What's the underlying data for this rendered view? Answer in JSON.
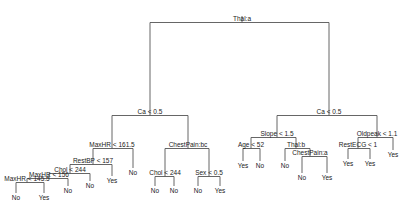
{
  "diagram": {
    "type": "decision-tree",
    "nodes": [
      {
        "id": "root",
        "label": "Thal:a",
        "x": 242,
        "y": 21
      },
      {
        "id": "L",
        "label": "Ca < 0.5",
        "x": 150,
        "y": 114
      },
      {
        "id": "R",
        "label": "Ca < 0.5",
        "x": 329,
        "y": 114
      },
      {
        "id": "LL",
        "label": "MaxHR < 161.5",
        "x": 112,
        "y": 147
      },
      {
        "id": "LR",
        "label": "ChestPain:bc",
        "x": 188,
        "y": 147
      },
      {
        "id": "LLL",
        "label": "RestBP < 157",
        "x": 93,
        "y": 163
      },
      {
        "id": "LLR",
        "label": "No",
        "x": 133,
        "y": 175
      },
      {
        "id": "LLLL",
        "label": "Chol < 244",
        "x": 70,
        "y": 172
      },
      {
        "id": "LLLR",
        "label": "Yes",
        "x": 112,
        "y": 183
      },
      {
        "id": "LLLLL",
        "label": "MaxHR < 156",
        "x": 49,
        "y": 177
      },
      {
        "id": "LLLLR",
        "label": "No",
        "x": 90,
        "y": 188
      },
      {
        "id": "LLLLLL",
        "label": "MaxHR < 145.5",
        "x": 27,
        "y": 181
      },
      {
        "id": "LLLLLR",
        "label": "No",
        "x": 68,
        "y": 193
      },
      {
        "id": "l1",
        "label": "No",
        "x": 16,
        "y": 200
      },
      {
        "id": "l2",
        "label": "Yes",
        "x": 44,
        "y": 200
      },
      {
        "id": "LRL",
        "label": "Chol < 244",
        "x": 165,
        "y": 175
      },
      {
        "id": "LRR",
        "label": "Sex < 0.5",
        "x": 209,
        "y": 175
      },
      {
        "id": "l3",
        "label": "No",
        "x": 155,
        "y": 193
      },
      {
        "id": "l4",
        "label": "No",
        "x": 174,
        "y": 193
      },
      {
        "id": "l5",
        "label": "No",
        "x": 198,
        "y": 193
      },
      {
        "id": "l6",
        "label": "Yes",
        "x": 220,
        "y": 193
      },
      {
        "id": "RL",
        "label": "Slope < 1.5",
        "x": 277,
        "y": 136
      },
      {
        "id": "RR",
        "label": "Oldpeak < 1.1",
        "x": 377,
        "y": 136
      },
      {
        "id": "RLL",
        "label": "Age < 52",
        "x": 251,
        "y": 147
      },
      {
        "id": "RLR",
        "label": "Thal:b",
        "x": 296,
        "y": 147
      },
      {
        "id": "l7",
        "label": "Yes",
        "x": 243,
        "y": 168
      },
      {
        "id": "l8",
        "label": "No",
        "x": 260,
        "y": 168
      },
      {
        "id": "l9",
        "label": "No",
        "x": 285,
        "y": 168
      },
      {
        "id": "RLRR",
        "label": "ChestPain:a",
        "x": 310,
        "y": 155
      },
      {
        "id": "l10",
        "label": "No",
        "x": 302,
        "y": 180
      },
      {
        "id": "l11",
        "label": "Yes",
        "x": 327,
        "y": 180
      },
      {
        "id": "RRL",
        "label": "RestECG < 1",
        "x": 358,
        "y": 147
      },
      {
        "id": "RRR",
        "label": "Yes",
        "x": 393,
        "y": 157
      },
      {
        "id": "l12",
        "label": "Yes",
        "x": 348,
        "y": 166
      },
      {
        "id": "l13",
        "label": "Yes",
        "x": 370,
        "y": 166
      }
    ],
    "edges": [
      {
        "parent": "root",
        "left": "L",
        "right": "R"
      },
      {
        "parent": "L",
        "left": "LL",
        "right": "LR"
      },
      {
        "parent": "LL",
        "left": "LLL",
        "right": "LLR"
      },
      {
        "parent": "LLL",
        "left": "LLLL",
        "right": "LLLR"
      },
      {
        "parent": "LLLL",
        "left": "LLLLL",
        "right": "LLLLR"
      },
      {
        "parent": "LLLLL",
        "left": "LLLLLL",
        "right": "LLLLLR"
      },
      {
        "parent": "LLLLLL",
        "left": "l1",
        "right": "l2"
      },
      {
        "parent": "LR",
        "left": "LRL",
        "right": "LRR"
      },
      {
        "parent": "LRL",
        "left": "l3",
        "right": "l4"
      },
      {
        "parent": "LRR",
        "left": "l5",
        "right": "l6"
      },
      {
        "parent": "R",
        "left": "RL",
        "right": "RR"
      },
      {
        "parent": "RL",
        "left": "RLL",
        "right": "RLR"
      },
      {
        "parent": "RLL",
        "left": "l7",
        "right": "l8"
      },
      {
        "parent": "RLR",
        "left": "l9",
        "right": "RLRR"
      },
      {
        "parent": "RLRR",
        "left": "l10",
        "right": "l11"
      },
      {
        "parent": "RR",
        "left": "RRL",
        "right": "RRR"
      },
      {
        "parent": "RRL",
        "left": "l12",
        "right": "l13"
      }
    ]
  }
}
